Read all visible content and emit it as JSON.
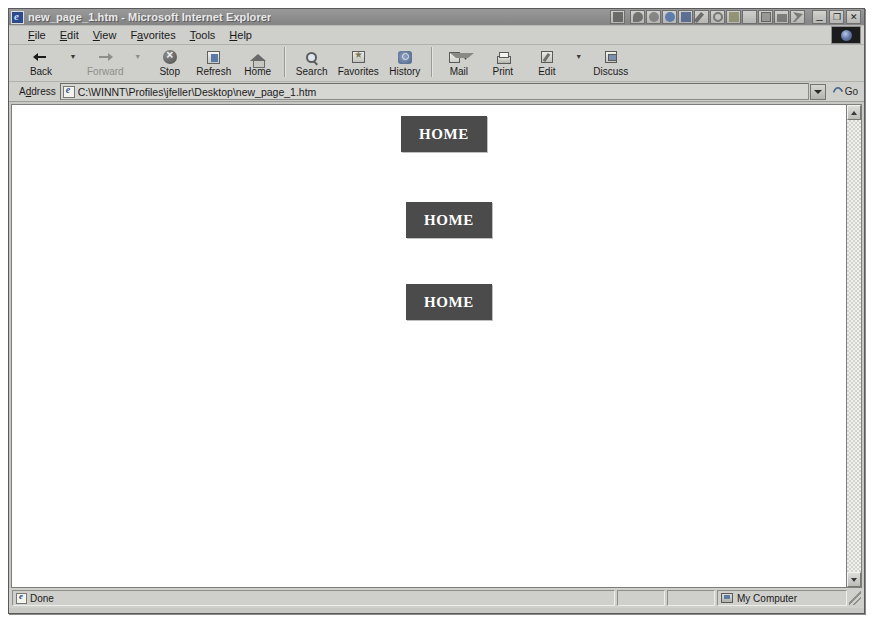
{
  "window": {
    "title": "new_page_1.htm - Microsoft Internet Explorer",
    "doc_icon": "ie-document-icon",
    "buttons": {
      "minimize": "_",
      "restore": "❐",
      "close": "✕"
    },
    "tray_icons": [
      "grid-icon",
      "magnifier-icon",
      "clock-icon",
      "internet-explorer-icon",
      "word-icon",
      "pen-icon",
      "circle-icon",
      "note-icon",
      "close-x-icon",
      "square-icon",
      "envelope-icon",
      "scissors-icon"
    ]
  },
  "menu": {
    "items": [
      {
        "label": "File",
        "accel": "F"
      },
      {
        "label": "Edit",
        "accel": "E"
      },
      {
        "label": "View",
        "accel": "V"
      },
      {
        "label": "Favorites",
        "accel": "a"
      },
      {
        "label": "Tools",
        "accel": "T"
      },
      {
        "label": "Help",
        "accel": "H"
      }
    ],
    "logo_name": "internet-explorer-animated-logo"
  },
  "toolbar": {
    "buttons": [
      {
        "label": "Back",
        "icon": "back-arrow-icon",
        "disabled": false,
        "dropdown": true
      },
      {
        "label": "Forward",
        "icon": "forward-arrow-icon",
        "disabled": true,
        "dropdown": true
      },
      {
        "label": "Stop",
        "icon": "stop-icon",
        "disabled": false,
        "dropdown": false
      },
      {
        "label": "Refresh",
        "icon": "refresh-icon",
        "disabled": false,
        "dropdown": false
      },
      {
        "label": "Home",
        "icon": "home-icon",
        "disabled": false,
        "dropdown": false
      },
      {
        "label": "Search",
        "icon": "search-icon",
        "disabled": false,
        "dropdown": false
      },
      {
        "label": "Favorites",
        "icon": "favorites-star-icon",
        "disabled": false,
        "dropdown": false
      },
      {
        "label": "History",
        "icon": "history-icon",
        "disabled": false,
        "dropdown": false
      },
      {
        "label": "Mail",
        "icon": "mail-icon",
        "disabled": false,
        "dropdown": true
      },
      {
        "label": "Print",
        "icon": "printer-icon",
        "disabled": false,
        "dropdown": false
      },
      {
        "label": "Edit",
        "icon": "edit-pencil-icon",
        "disabled": false,
        "dropdown": true
      },
      {
        "label": "Discuss",
        "icon": "discuss-icon",
        "disabled": false,
        "dropdown": false
      }
    ]
  },
  "address": {
    "label": "Address",
    "label_accel": "d",
    "value": "C:\\WINNT\\Profiles\\jfeller\\Desktop\\new_page_1.htm",
    "placeholder": "",
    "doc_icon": "ie-document-icon",
    "dropdown_icon": "chevron-down-icon",
    "go_label": "Go",
    "go_icon": "go-arrow-icon"
  },
  "page": {
    "background": "#ffffff",
    "buttons": [
      {
        "label": "HOME",
        "x": 389,
        "y": 11,
        "color": "#4b4b4b"
      },
      {
        "label": "HOME",
        "x": 394,
        "y": 97,
        "color": "#4b4b4b"
      },
      {
        "label": "HOME",
        "x": 394,
        "y": 179,
        "color": "#4b4b4b"
      }
    ]
  },
  "scrollbar": {
    "up_icon": "scroll-up-arrow-icon",
    "down_icon": "scroll-down-arrow-icon"
  },
  "statusbar": {
    "message": "Done",
    "message_icon": "ie-document-icon",
    "zone": "My Computer",
    "zone_icon": "my-computer-icon"
  }
}
